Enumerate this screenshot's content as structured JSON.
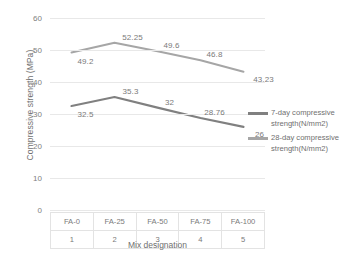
{
  "chart_data": {
    "type": "line",
    "title": "",
    "xlabel": "Mix designation",
    "ylabel": "Compressive strength (MPa)",
    "categories": [
      "FA-0",
      "FA-25",
      "FA-50",
      "FA-75",
      "FA-100"
    ],
    "category_indices": [
      "1",
      "2",
      "3",
      "4",
      "5"
    ],
    "ylim": [
      0,
      60
    ],
    "yticks": [
      "0",
      "10",
      "20",
      "30",
      "40",
      "50",
      "60"
    ],
    "grid": true,
    "legend_position": "right",
    "series": [
      {
        "name": "7-day compressive strength(N/mm2)",
        "color": "#808080",
        "values": [
          32.5,
          35.3,
          32,
          28.76,
          26
        ],
        "labels": [
          "32.5",
          "35.3",
          "32",
          "28.76",
          "26"
        ]
      },
      {
        "name": "28-day compressive strength(N/mm2)",
        "color": "#a6a6a6",
        "values": [
          49.2,
          52.25,
          49.6,
          46.8,
          43.23
        ],
        "labels": [
          "49.2",
          "52.25",
          "49.6",
          "46.8",
          "43.23"
        ]
      }
    ]
  },
  "axis": {
    "y_title": "Compressive strength (MPa)",
    "x_title": "Mix designation"
  },
  "colors": {
    "gridline": "#e8e8e8",
    "text": "#7a7a7a",
    "series_7day": "#808080",
    "series_28day": "#a6a6a6"
  }
}
